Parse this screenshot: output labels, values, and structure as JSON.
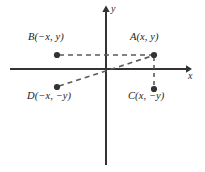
{
  "figure": {
    "background_color": "#ffffff",
    "width": 205,
    "height": 172
  },
  "axes": {
    "x_label": "x",
    "y_label": "y",
    "origin": {
      "x": 106,
      "y": 69
    },
    "x_axis": {
      "x1": 10,
      "y1": 69,
      "x2": 188,
      "y2": 69,
      "arrow": "right"
    },
    "y_axis": {
      "x1": 106,
      "y1": 165,
      "x2": 106,
      "y2": 8,
      "arrow": "up"
    },
    "color": "#333333"
  },
  "points": [
    {
      "id": "A",
      "label": "A(x, y)",
      "coords": {
        "x": 154,
        "y": 55
      },
      "quadrant": "I",
      "label_position": "above"
    },
    {
      "id": "B",
      "label": "B(−x, y)",
      "coords": {
        "x": 57,
        "y": 55
      },
      "quadrant": "II",
      "label_position": "above"
    },
    {
      "id": "C",
      "label": "C(x, −y)",
      "coords": {
        "x": 154,
        "y": 89
      },
      "quadrant": "IV",
      "label_position": "below"
    },
    {
      "id": "D",
      "label": "D(−x, −y)",
      "coords": {
        "x": 57,
        "y": 87
      },
      "quadrant": "III",
      "label_position": "below"
    }
  ],
  "connectors": [
    {
      "name": "b-to-a",
      "from": "B",
      "to": "A",
      "style": "dashed",
      "orientation": "horizontal"
    },
    {
      "name": "d-to-a",
      "from": "D",
      "to": "A",
      "style": "dashed",
      "orientation": "diagonal-through-origin"
    },
    {
      "name": "a-to-c",
      "from": "A",
      "to": "C",
      "style": "dashed",
      "orientation": "vertical"
    }
  ],
  "style": {
    "point_color": "#333333",
    "dash_color": "#5a5a5a",
    "text_color": "#1c1c1c",
    "point_radius": 3
  }
}
